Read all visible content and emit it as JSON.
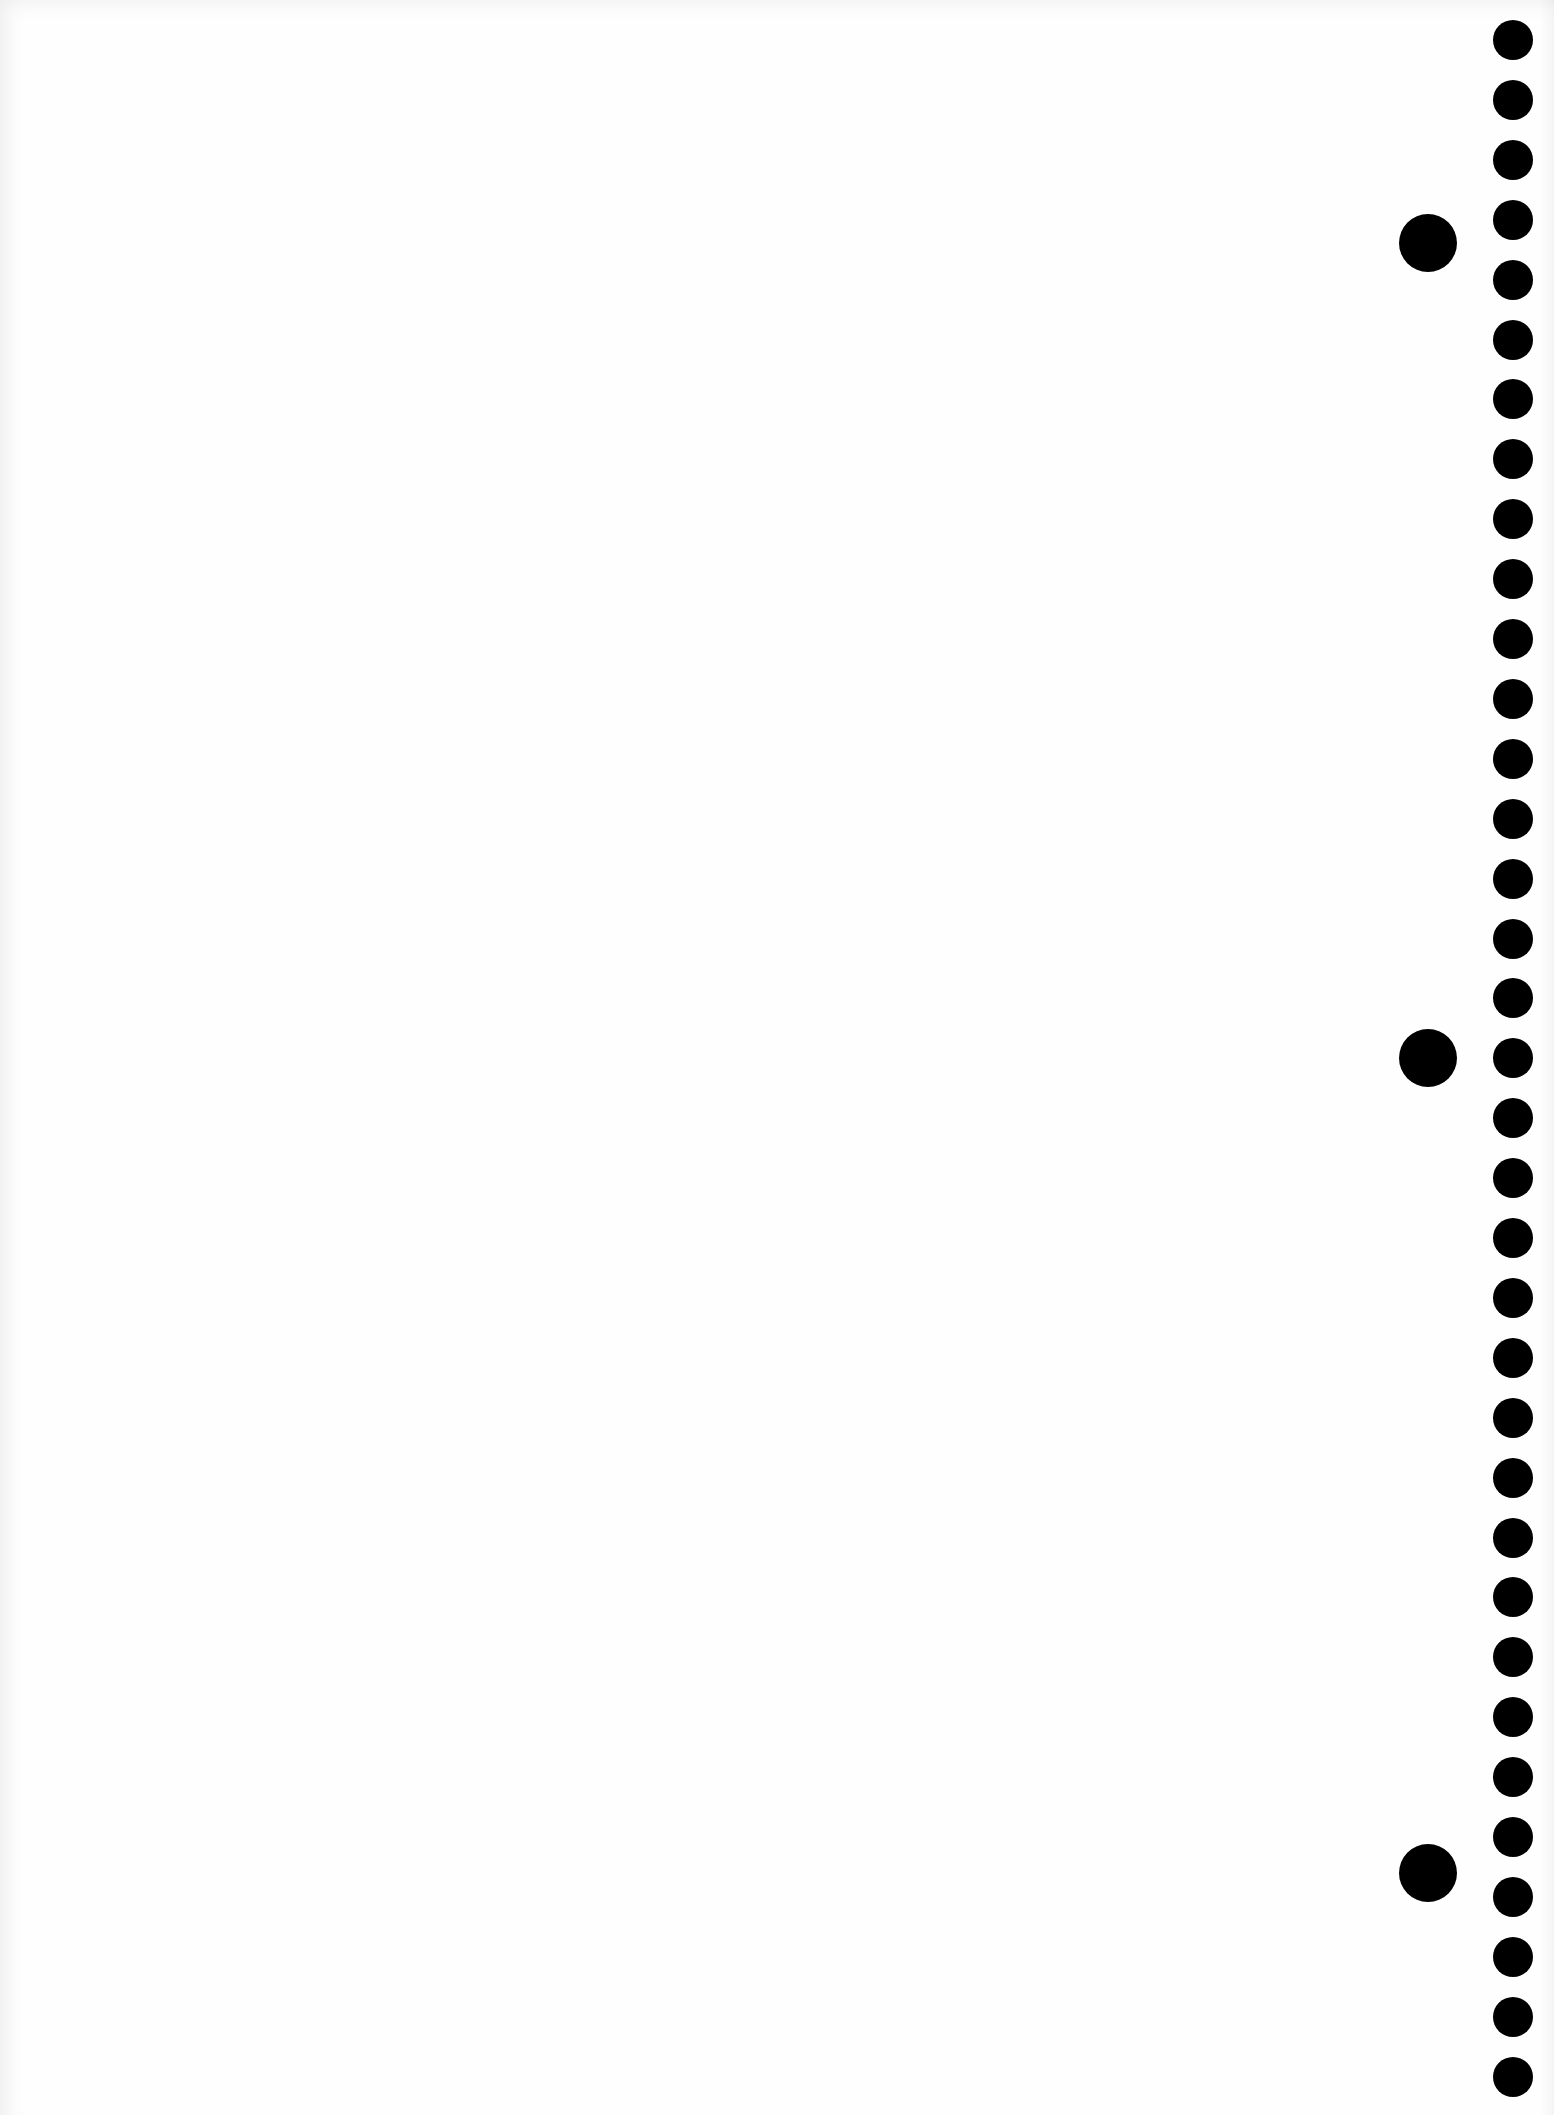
{
  "page": {
    "description": "Blank sheet of spiral-notebook paper with punched binding holes along the right edge",
    "background_color": "#fefefe",
    "hole_color": "#000000"
  },
  "small_holes": {
    "count": 35,
    "center_x": 1513,
    "first_center_y": 40,
    "spacing": 59.9,
    "diameter": 40
  },
  "large_holes": {
    "center_x": 1428,
    "diameter": 58,
    "centers_y": [
      243,
      1058,
      1873
    ]
  }
}
